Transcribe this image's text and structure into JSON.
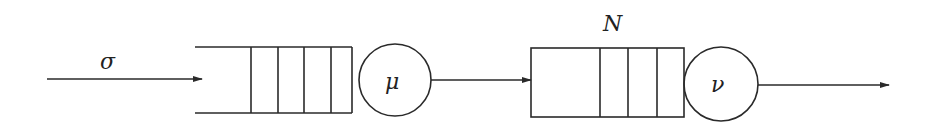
{
  "diagram": {
    "type": "tandem-queue",
    "arrival": {
      "label": "σ"
    },
    "stations": [
      {
        "id": "station-1",
        "server_label": "μ",
        "queue_label": "",
        "buffer_slots_shown": 4,
        "capacity": "infinite"
      },
      {
        "id": "station-2",
        "server_label": "ν",
        "queue_label": "N",
        "buffer_slots_shown": 3,
        "capacity": "finite"
      }
    ],
    "edges": [
      {
        "from": "arrival",
        "to": "station-1"
      },
      {
        "from": "station-1",
        "to": "station-2"
      },
      {
        "from": "station-2",
        "to": "departure"
      }
    ],
    "colors": {
      "stroke": "#2a2a2a",
      "background": "#ffffff"
    }
  }
}
